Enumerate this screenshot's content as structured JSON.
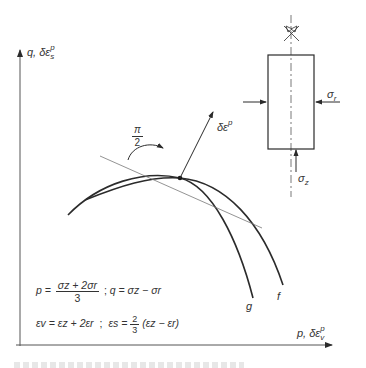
{
  "diagram": {
    "axes": {
      "y_label": {
        "main": "q, δε",
        "sub": "s",
        "sup": "p"
      },
      "x_label": {
        "main": "p, δε",
        "sub": "v",
        "sup": "p"
      }
    },
    "curves": [
      {
        "id": "g",
        "label": "g"
      },
      {
        "id": "f",
        "label": "f"
      }
    ],
    "normal_vector": {
      "main": "δε",
      "sup": "p"
    },
    "angle_label": {
      "num": "π",
      "den": "2"
    },
    "specimen": {
      "radial_stress": {
        "main": "σ",
        "sub": "r"
      },
      "axial_stress": {
        "main": "σ",
        "sub": "z"
      }
    },
    "formulas": {
      "line1": {
        "p_lhs": "p =",
        "p_num": "σz + 2σr",
        "p_den": "3",
        "sep": ";",
        "q_expr": "q = σz − σr"
      },
      "line2": {
        "ev_expr": "εv = εz + 2εr",
        "sep": ";",
        "es_lhs": "εs =",
        "es_num": "2",
        "es_den": "3",
        "es_rhs": "(εz − εr)"
      }
    }
  },
  "colors": {
    "line": "#2b2b2b",
    "tangent": "#777777",
    "background": "#ffffff"
  }
}
